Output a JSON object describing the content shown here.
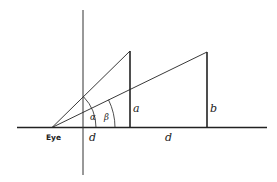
{
  "diagram": {
    "labels": {
      "eye": "Eye",
      "d_first": "d",
      "d_second": "d",
      "a": "a",
      "b": "b",
      "alpha": "α",
      "beta": "β"
    },
    "colors": {
      "line": "#222222",
      "background": "#ffffff"
    }
  }
}
